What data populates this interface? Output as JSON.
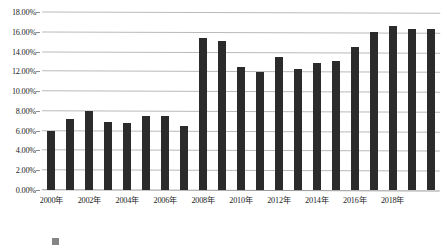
{
  "chart_data": {
    "type": "bar",
    "title": "",
    "xlabel": "",
    "ylabel": "",
    "ylim": [
      0,
      18
    ],
    "ytick_step": 2,
    "grid": true,
    "legend": "none",
    "yticks": [
      "0.00%",
      "2.00%",
      "4.00%",
      "6.00%",
      "8.00%",
      "10.00%",
      "12.00%",
      "14.00%",
      "16.00%",
      "18.00%"
    ],
    "categories": [
      "2000年",
      "2001年",
      "2002年",
      "2003年",
      "2004年",
      "2005年",
      "2006年",
      "2007年",
      "2008年",
      "2009年",
      "2010年",
      "2011年",
      "2012年",
      "2013年",
      "2014年",
      "2015年",
      "2016年",
      "2017年",
      "2018年",
      "2019年",
      "2020年"
    ],
    "xtick_labels": [
      "2000年",
      "2002年",
      "2004年",
      "2006年",
      "2008年",
      "2010年",
      "2012年",
      "2014年",
      "2016年",
      "2018年"
    ],
    "values": [
      6.0,
      7.2,
      8.0,
      6.9,
      6.8,
      7.5,
      7.5,
      6.5,
      15.4,
      15.1,
      12.4,
      11.9,
      13.5,
      12.2,
      12.8,
      13.0,
      14.5,
      16.0,
      16.6,
      16.3,
      16.3
    ],
    "bar_color": "#2b2b2b",
    "gridline_color": "#b9b9b9",
    "background_color": "#ffffff"
  },
  "caption": {
    "text": ""
  }
}
